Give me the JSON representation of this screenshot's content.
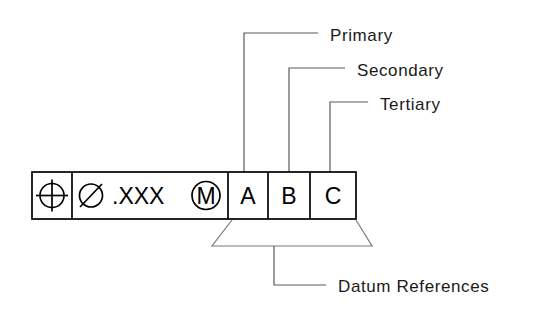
{
  "diagram": {
    "background_color": "#ffffff",
    "line_color": "#000000",
    "leader_color": "#5a5a5a",
    "text_color": "#1a1a1a"
  },
  "feature_control_frame": {
    "cells": [
      {
        "name": "geometric-characteristic",
        "symbol_name": "position-symbol",
        "text": ""
      },
      {
        "name": "tolerance-zone",
        "diameter_symbol_name": "diameter-symbol",
        "tolerance_value": ".XXX",
        "modifier_name": "mmc-modifier-symbol",
        "modifier_letter": "M"
      },
      {
        "name": "datum-primary",
        "text": "A"
      },
      {
        "name": "datum-secondary",
        "text": "B"
      },
      {
        "name": "datum-tertiary",
        "text": "C"
      }
    ]
  },
  "callouts": {
    "primary": "Primary",
    "secondary": "Secondary",
    "tertiary": "Tertiary",
    "datum_references": "Datum References"
  }
}
